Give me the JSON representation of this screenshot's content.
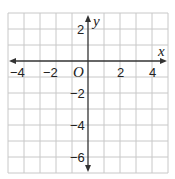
{
  "diagram": {
    "type": "coordinate-plane",
    "x_axis": {
      "label": "x",
      "min": -5,
      "max": 5,
      "ticks": [
        "−4",
        "−2",
        "2",
        "4"
      ],
      "tick_values": [
        -4,
        -2,
        2,
        4
      ]
    },
    "y_axis": {
      "label": "y",
      "min": -7,
      "max": 3,
      "ticks": [
        "2",
        "−2",
        "−4",
        "−6"
      ],
      "tick_values": [
        2,
        -2,
        -4,
        -6
      ]
    },
    "origin_label": "O",
    "grid": {
      "spacing": 1,
      "on": true
    },
    "colors": {
      "grid": "#c8c8c8",
      "axis": "#333333",
      "text": "#222222"
    }
  }
}
